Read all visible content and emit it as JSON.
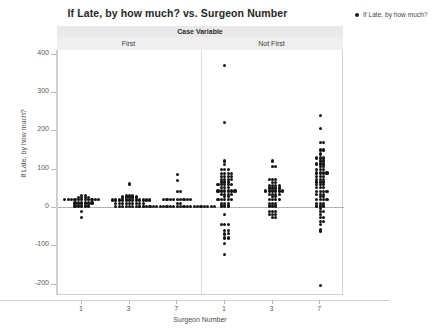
{
  "chart": {
    "title": "If Late, by how much? vs. Surgeon Number",
    "legend": {
      "marker": "filled-circle",
      "label": "If Late, by how much?"
    },
    "panel_strip": {
      "group_title": "Case Variable",
      "panels": [
        "First",
        "Not First"
      ]
    },
    "xlabel": "Surgeon Number",
    "ylabel": "If Late, by how much?",
    "y_ticks": [
      400,
      300,
      200,
      100,
      0,
      -100,
      -200
    ],
    "x_ticks": [
      "1",
      "3",
      "7",
      "1",
      "3",
      "7"
    ],
    "colors": {
      "marker": "#161616",
      "strip_outer": "#e9e9e9",
      "strip_inner": "#efefef",
      "frame": "#cfcfcf",
      "zero_line": "#b3b3b3"
    }
  },
  "chart_data": {
    "type": "scatter",
    "plot_style": "individual-value-plot-dotplot",
    "title": "If Late, by how much? vs. Surgeon Number",
    "xlabel": "Surgeon Number",
    "ylabel": "If Late, by how much?",
    "ylim": [
      -230,
      410
    ],
    "y_ticks": [
      -200,
      -100,
      0,
      100,
      200,
      300,
      400
    ],
    "grid": false,
    "legend_position": "right",
    "panel_variable": "Case Variable",
    "panels": [
      "First",
      "Not First"
    ],
    "categories": [
      "1",
      "3",
      "7"
    ],
    "groups": [
      {
        "panel": "First",
        "surgeon": "1",
        "values": [
          30,
          30,
          28,
          25,
          25,
          25,
          22,
          22,
          20,
          20,
          20,
          20,
          18,
          18,
          15,
          15,
          15,
          12,
          12,
          10,
          10,
          10,
          8,
          5,
          5,
          2,
          0,
          0,
          -12,
          -28
        ]
      },
      {
        "panel": "First",
        "surgeon": "3",
        "values": [
          60,
          32,
          30,
          30,
          28,
          28,
          25,
          25,
          25,
          22,
          22,
          20,
          20,
          20,
          20,
          18,
          18,
          15,
          15,
          15,
          15,
          12,
          12,
          12,
          10,
          10,
          10,
          8,
          8,
          8,
          5,
          5,
          5,
          2,
          2,
          0,
          0,
          0,
          0
        ]
      },
      {
        "panel": "First",
        "surgeon": "7",
        "values": [
          85,
          70,
          40,
          40,
          22,
          22,
          20,
          20,
          20,
          18,
          18,
          15,
          15,
          10,
          8,
          5,
          5,
          5,
          5,
          2,
          2,
          2,
          2,
          0,
          0,
          0,
          0,
          0,
          0,
          0,
          0,
          0,
          0,
          0,
          0,
          0,
          0,
          0
        ]
      },
      {
        "panel": "Not First",
        "surgeon": "1",
        "values": [
          370,
          220,
          120,
          110,
          100,
          100,
          95,
          90,
          90,
          88,
          85,
          82,
          80,
          80,
          78,
          75,
          72,
          70,
          70,
          68,
          65,
          62,
          60,
          60,
          58,
          55,
          55,
          52,
          50,
          48,
          45,
          45,
          42,
          40,
          40,
          38,
          35,
          32,
          30,
          30,
          28,
          25,
          22,
          20,
          20,
          18,
          15,
          12,
          10,
          8,
          5,
          2,
          0,
          -20,
          -45,
          -45,
          -45,
          -60,
          -62,
          -68,
          -70,
          -72,
          -80,
          -82,
          -95,
          -125
        ]
      },
      {
        "panel": "Not First",
        "surgeon": "3",
        "values": [
          120,
          105,
          105,
          72,
          70,
          70,
          65,
          62,
          60,
          58,
          55,
          55,
          52,
          50,
          48,
          48,
          45,
          45,
          42,
          40,
          40,
          38,
          35,
          35,
          32,
          30,
          28,
          25,
          22,
          20,
          18,
          15,
          12,
          10,
          8,
          5,
          2,
          0,
          -10,
          -12,
          -15,
          -18,
          -20,
          -22,
          -25,
          -28
        ]
      },
      {
        "panel": "Not First",
        "surgeon": "7",
        "values": [
          238,
          205,
          170,
          168,
          150,
          148,
          140,
          138,
          130,
          128,
          125,
          122,
          118,
          115,
          112,
          110,
          108,
          105,
          100,
          98,
          95,
          92,
          90,
          88,
          85,
          82,
          80,
          78,
          75,
          72,
          70,
          68,
          65,
          62,
          60,
          58,
          55,
          52,
          50,
          48,
          45,
          42,
          40,
          38,
          35,
          32,
          30,
          28,
          25,
          22,
          20,
          18,
          15,
          12,
          10,
          8,
          5,
          2,
          0,
          -5,
          -10,
          -15,
          -20,
          -25,
          -30,
          -35,
          -40,
          -45,
          -60,
          -65,
          -205
        ]
      }
    ]
  }
}
